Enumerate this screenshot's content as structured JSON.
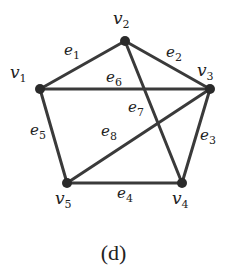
{
  "caption": "(d)",
  "vertices": [
    {
      "id": "v1",
      "name": "v",
      "sub": "1",
      "x": 40,
      "y": 89,
      "lx": 10,
      "ly": 78
    },
    {
      "id": "v2",
      "name": "v",
      "sub": "2",
      "x": 125,
      "y": 41,
      "lx": 113,
      "ly": 24
    },
    {
      "id": "v3",
      "name": "v",
      "sub": "3",
      "x": 210,
      "y": 89,
      "lx": 197,
      "ly": 76
    },
    {
      "id": "v4",
      "name": "v",
      "sub": "4",
      "x": 182,
      "y": 183,
      "lx": 172,
      "ly": 204
    },
    {
      "id": "v5",
      "name": "v",
      "sub": "5",
      "x": 67,
      "y": 183,
      "lx": 55,
      "ly": 204
    }
  ],
  "edges": [
    {
      "id": "e1",
      "name": "e",
      "sub": "1",
      "from": "v1",
      "to": "v2",
      "lx": 64,
      "ly": 55
    },
    {
      "id": "e2",
      "name": "e",
      "sub": "2",
      "from": "v2",
      "to": "v3",
      "lx": 166,
      "ly": 57
    },
    {
      "id": "e3",
      "name": "e",
      "sub": "3",
      "from": "v3",
      "to": "v4",
      "lx": 200,
      "ly": 140
    },
    {
      "id": "e4",
      "name": "e",
      "sub": "4",
      "from": "v5",
      "to": "v4",
      "lx": 117,
      "ly": 198
    },
    {
      "id": "e5",
      "name": "e",
      "sub": "5",
      "from": "v1",
      "to": "v5",
      "lx": 30,
      "ly": 135
    },
    {
      "id": "e6",
      "name": "e",
      "sub": "6",
      "from": "v1",
      "to": "v3",
      "lx": 106,
      "ly": 82
    },
    {
      "id": "e7",
      "name": "e",
      "sub": "7",
      "from": "v2",
      "to": "v4",
      "lx": 128,
      "ly": 112
    },
    {
      "id": "e8",
      "name": "e",
      "sub": "8",
      "from": "v3",
      "to": "v5",
      "lx": 101,
      "ly": 136
    }
  ]
}
